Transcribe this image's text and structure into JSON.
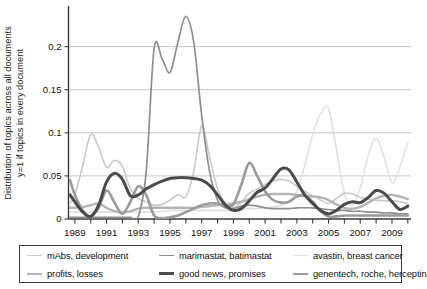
{
  "chart_data": {
    "type": "line",
    "title": "",
    "xlabel": "",
    "ylabel_line1": "Distribution of topics across all documents",
    "ylabel_line2": "y=1 if topics in every document",
    "xlim": [
      1988.6,
      2010.2
    ],
    "ylim": [
      0,
      0.2425
    ],
    "xticks": [
      1989,
      1991,
      1993,
      1995,
      1997,
      1999,
      2001,
      2003,
      2005,
      2007,
      2009
    ],
    "xtick_labels": [
      "1989",
      "1991",
      "1993",
      "1995",
      "1997",
      "1999",
      "2001",
      "2003",
      "2005",
      "2007",
      "2009"
    ],
    "yticks": [
      0,
      0.05,
      0.1,
      0.15,
      0.2
    ],
    "ytick_labels": [
      "0",
      "0.05",
      "0.1",
      "0.15",
      "0.2"
    ],
    "grid": "horizontal",
    "legend_position": "below-axes",
    "x": [
      1988.7,
      1989,
      1989.5,
      1990,
      1990.5,
      1991,
      1991.5,
      1992,
      1992.5,
      1993,
      1993.5,
      1994,
      1994.5,
      1995,
      1995.5,
      1996,
      1996.5,
      1997,
      1997.5,
      1998,
      1998.5,
      1999,
      1999.5,
      2000,
      2000.5,
      2001,
      2001.5,
      2002,
      2002.5,
      2003,
      2003.5,
      2004,
      2004.5,
      2005,
      2005.5,
      2006,
      2006.5,
      2007,
      2007.5,
      2008,
      2008.5,
      2009,
      2009.5,
      2010
    ],
    "series": [
      {
        "name": "mAbs, development",
        "color": "#c9c9c9",
        "width": 1.6,
        "values": [
          0.018,
          0.028,
          0.062,
          0.098,
          0.083,
          0.06,
          0.068,
          0.061,
          0.035,
          0.024,
          0.02,
          0.016,
          0.017,
          0.022,
          0.028,
          0.026,
          0.055,
          0.108,
          0.072,
          0.035,
          0.018,
          0.013,
          0.02,
          0.03,
          0.035,
          0.04,
          0.044,
          0.046,
          0.044,
          0.038,
          0.032,
          0.027,
          0.022,
          0.018,
          0.024,
          0.03,
          0.029,
          0.025,
          0.023,
          0.022,
          0.021,
          0.021,
          0.02,
          0.018
        ]
      },
      {
        "name": "marimastat, batimastat",
        "color": "#8e8e8e",
        "width": 1.7,
        "values": [
          0.002,
          0.002,
          0.002,
          0.002,
          0.002,
          0.002,
          0.002,
          0.002,
          0.002,
          0.003,
          0.055,
          0.198,
          0.186,
          0.17,
          0.205,
          0.235,
          0.205,
          0.12,
          0.055,
          0.022,
          0.013,
          0.012,
          0.015,
          0.016,
          0.015,
          0.013,
          0.012,
          0.012,
          0.012,
          0.013,
          0.013,
          0.013,
          0.012,
          0.011,
          0.01,
          0.01,
          0.009,
          0.009,
          0.008,
          0.008,
          0.007,
          0.007,
          0.006,
          0.006
        ]
      },
      {
        "name": "avastin, breast cancer",
        "color": "#e0e0e0",
        "width": 1.6,
        "values": [
          0.008,
          0.008,
          0.008,
          0.008,
          0.008,
          0.008,
          0.008,
          0.008,
          0.008,
          0.008,
          0.008,
          0.008,
          0.009,
          0.01,
          0.01,
          0.01,
          0.01,
          0.01,
          0.01,
          0.01,
          0.01,
          0.01,
          0.011,
          0.012,
          0.012,
          0.013,
          0.014,
          0.016,
          0.02,
          0.032,
          0.062,
          0.098,
          0.122,
          0.128,
          0.08,
          0.03,
          0.016,
          0.036,
          0.074,
          0.094,
          0.072,
          0.042,
          0.06,
          0.089
        ]
      },
      {
        "name": "profits, losses",
        "color": "#b4b4b4",
        "width": 2.4,
        "values": [
          0.013,
          0.013,
          0.014,
          0.016,
          0.018,
          0.013,
          0.009,
          0.008,
          0.009,
          0.012,
          0.013,
          0.013,
          0.013,
          0.013,
          0.013,
          0.013,
          0.013,
          0.014,
          0.015,
          0.016,
          0.017,
          0.018,
          0.02,
          0.023,
          0.026,
          0.028,
          0.029,
          0.029,
          0.029,
          0.028,
          0.027,
          0.026,
          0.025,
          0.022,
          0.017,
          0.013,
          0.012,
          0.014,
          0.019,
          0.024,
          0.027,
          0.028,
          0.026,
          0.023
        ]
      },
      {
        "name": "good news, promises",
        "color": "#4a4a4a",
        "width": 3.0,
        "values": [
          0.028,
          0.02,
          0.008,
          0.003,
          0.016,
          0.043,
          0.053,
          0.046,
          0.027,
          0.028,
          0.035,
          0.04,
          0.044,
          0.047,
          0.048,
          0.048,
          0.047,
          0.045,
          0.039,
          0.028,
          0.016,
          0.01,
          0.012,
          0.021,
          0.031,
          0.036,
          0.047,
          0.058,
          0.057,
          0.043,
          0.028,
          0.018,
          0.01,
          0.006,
          0.01,
          0.017,
          0.02,
          0.019,
          0.025,
          0.033,
          0.03,
          0.02,
          0.011,
          0.015
        ]
      },
      {
        "name": "genentech, roche, herceptin",
        "color": "#9a9a9a",
        "width": 2.6,
        "values": [
          0.045,
          0.028,
          0.01,
          0.003,
          0.013,
          0.033,
          0.019,
          0.006,
          0.02,
          0.038,
          0.028,
          0.004,
          0.001,
          0.002,
          0.004,
          0.008,
          0.012,
          0.016,
          0.018,
          0.018,
          0.016,
          0.017,
          0.04,
          0.065,
          0.05,
          0.032,
          0.022,
          0.019,
          0.02,
          0.026,
          0.027,
          0.02,
          0.009,
          0.003,
          0.003,
          0.004,
          0.004,
          0.004,
          0.004,
          0.004,
          0.004,
          0.004,
          0.004,
          0.004
        ]
      }
    ]
  },
  "legend": {
    "rows": [
      [
        {
          "label": "mAbs, development",
          "color": "#c9c9c9",
          "width": 1.8
        },
        {
          "label": "marimastat, batimastat",
          "color": "#8e8e8e",
          "width": 1.8
        },
        {
          "label": "avastin, breast cancer",
          "color": "#e0e0e0",
          "width": 1.8
        }
      ],
      [
        {
          "label": "profits, losses",
          "color": "#b4b4b4",
          "width": 2.4
        },
        {
          "label": "good news, promises",
          "color": "#4a4a4a",
          "width": 3.2
        },
        {
          "label": "genentech, roche, herceptin",
          "color": "#9a9a9a",
          "width": 2.6
        }
      ]
    ]
  },
  "style": {
    "axis_color": "#3a3a3a",
    "grid_color": "#bdbdbd",
    "text_color": "#111111",
    "background": "#ffffff"
  }
}
